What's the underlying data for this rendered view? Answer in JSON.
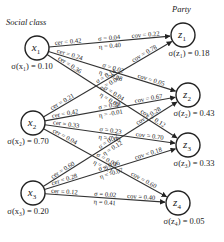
{
  "titles": {
    "left": "Social class",
    "right": "Party"
  },
  "sources": [
    {
      "id": "x1",
      "name": "x",
      "sub": "1",
      "sigma_label": "σ(x₁) = 0.10",
      "sigma": 0.1,
      "cx": 37,
      "cy": 48
    },
    {
      "id": "x2",
      "name": "x",
      "sub": "2",
      "sigma_label": "σ(x₂) = 0.70",
      "sigma": 0.7,
      "cx": 33,
      "cy": 123
    },
    {
      "id": "x3",
      "name": "x",
      "sub": "3",
      "sigma_label": "σ(x₃) = 0.20",
      "sigma": 0.2,
      "cx": 33,
      "cy": 193
    }
  ],
  "targets": [
    {
      "id": "z1",
      "name": "z",
      "sub": "1",
      "sigma_label": "σ(z₁) = 0.18",
      "sigma": 0.18,
      "cx": 183,
      "cy": 35
    },
    {
      "id": "z2",
      "name": "z",
      "sub": "2",
      "sigma_label": "σ(z₂) = 0.43",
      "sigma": 0.43,
      "cx": 188,
      "cy": 95
    },
    {
      "id": "z3",
      "name": "z",
      "sub": "3",
      "sigma_label": "σ(z₃) = 0.33",
      "sigma": 0.33,
      "cx": 188,
      "cy": 145
    },
    {
      "id": "z4",
      "name": "z",
      "sub": "4",
      "sigma_label": "σ(z₄) = 0.05",
      "sigma": 0.05,
      "cx": 178,
      "cy": 203
    }
  ],
  "edges": [
    {
      "from": "x1",
      "to": "z1",
      "cer": "cer = 0.42",
      "sigma": "σ = 0.04",
      "eta": "η = 0.40",
      "cov": "cov = 0.22"
    },
    {
      "from": "x1",
      "to": "z2",
      "cer": "cer = 0.24",
      "sigma": "σ = 0.02",
      "eta": "η = -0.28",
      "cov": "cov = 0.05"
    },
    {
      "from": "x1",
      "to": "z3",
      "cer": "cer = 0.36",
      "sigma": "σ = 0.04",
      "eta": "η = 0.04",
      "cov": "cov = 0.12"
    },
    {
      "from": "x2",
      "to": "z1",
      "cer": "cer = 0.21",
      "sigma": "σ = 0.14",
      "eta": "η = 0.08",
      "cov": "cov = 0.78"
    },
    {
      "from": "x2",
      "to": "z2",
      "cer": "cer = 0.42",
      "sigma": "σ = 0.29",
      "eta": "η = -0.01",
      "cov": "cov = 0.67"
    },
    {
      "from": "x2",
      "to": "z3",
      "cer": "cer = 0.33",
      "sigma": "σ = 0.23",
      "eta": "η = 0.00",
      "cov": "cov = 0.70"
    },
    {
      "from": "x2",
      "to": "z4",
      "cer": "cer = 0.04",
      "sigma": "σ = 0.03",
      "eta": "η = -0.1",
      "cov": "cov = 0.60"
    },
    {
      "from": "x3",
      "to": "z2",
      "cer": "cer = 0.60",
      "sigma": "σ = 0.12",
      "eta": "η = 0.12",
      "cov": "cov = 0.28"
    },
    {
      "from": "x3",
      "to": "z3",
      "cer": "cer = 0.28",
      "sigma": "σ = 0.06",
      "eta": "η = -0.07",
      "cov": "cov = 0.18"
    },
    {
      "from": "x3",
      "to": "z4",
      "cer": "cer = 0.12",
      "sigma": "σ = 0.02",
      "eta": "η = 0.41",
      "cov": "cov = 0.40"
    }
  ]
}
